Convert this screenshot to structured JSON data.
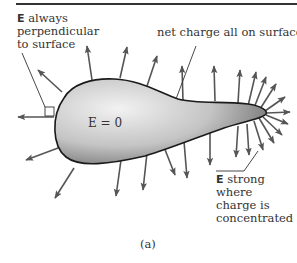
{
  "figure": {
    "caption": "(a)",
    "labels": {
      "perpendicular": {
        "symbol": "E",
        "lines": [
          " always",
          "perpendicular",
          "to surface"
        ]
      },
      "net_charge": "net charge all on surface",
      "interior": "E = 0",
      "strong": {
        "symbol": "E",
        "lines": [
          " strong",
          "where",
          "charge is",
          "concentrated"
        ]
      }
    },
    "colors": {
      "arrow": "#555555",
      "outline": "#1a1a1a",
      "conductor_light": "#f0f0f0",
      "conductor_dark": "#6e6e6e"
    }
  }
}
